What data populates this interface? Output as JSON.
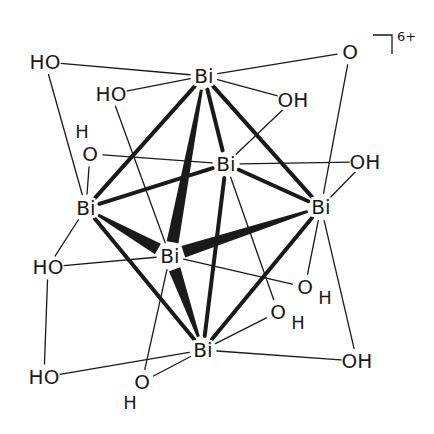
{
  "diagram": {
    "charge": "6+",
    "colors": {
      "bond": "#1a1a1a",
      "background": "#ffffff"
    },
    "atoms": [
      {
        "id": "bi_top",
        "label": "Bi",
        "x": 204,
        "y": 76
      },
      {
        "id": "bi_back",
        "label": "Bi",
        "x": 226,
        "y": 164
      },
      {
        "id": "bi_left",
        "label": "Bi",
        "x": 86,
        "y": 208
      },
      {
        "id": "bi_right",
        "label": "Bi",
        "x": 321,
        "y": 207
      },
      {
        "id": "bi_front",
        "label": "Bi",
        "x": 170,
        "y": 256
      },
      {
        "id": "bi_bottom",
        "label": "Bi",
        "x": 203,
        "y": 350
      },
      {
        "id": "o_tl",
        "label": "HO",
        "x": 45,
        "y": 62
      },
      {
        "id": "o_tl2",
        "label": "HO",
        "x": 111,
        "y": 94
      },
      {
        "id": "o_top_r",
        "label": "OH",
        "x": 293,
        "y": 100
      },
      {
        "id": "o_tr",
        "label": "O",
        "x": 350,
        "y": 52
      },
      {
        "id": "o_left_back",
        "label": "O",
        "x": 90,
        "y": 154
      },
      {
        "id": "o_right_back",
        "label": "OH",
        "x": 365,
        "y": 162
      },
      {
        "id": "o_left_mid",
        "label": "HO",
        "x": 48,
        "y": 267
      },
      {
        "id": "o_right_mid1",
        "label": "O",
        "x": 305,
        "y": 287
      },
      {
        "id": "o_right_mid2",
        "label": "O",
        "x": 278,
        "y": 312
      },
      {
        "id": "o_bottom_r",
        "label": "OH",
        "x": 357,
        "y": 361
      },
      {
        "id": "o_bottom_l",
        "label": "HO",
        "x": 44,
        "y": 377
      },
      {
        "id": "o_bottom_c",
        "label": "O",
        "x": 142,
        "y": 382
      }
    ],
    "h_labels": [
      {
        "id": "h_left_back",
        "label": "H",
        "x": 82,
        "y": 132
      },
      {
        "id": "h_right_mid1",
        "label": "H",
        "x": 325,
        "y": 298
      },
      {
        "id": "h_right_mid2",
        "label": "H",
        "x": 298,
        "y": 323
      },
      {
        "id": "h_bottom_c",
        "label": "H",
        "x": 130,
        "y": 403
      }
    ],
    "bonds_thick": [
      [
        "bi_top",
        "bi_left"
      ],
      [
        "bi_top",
        "bi_back"
      ],
      [
        "bi_top",
        "bi_right"
      ],
      [
        "bi_left",
        "bi_back"
      ],
      [
        "bi_left",
        "bi_bottom"
      ],
      [
        "bi_back",
        "bi_right"
      ],
      [
        "bi_right",
        "bi_bottom"
      ],
      [
        "bi_back",
        "bi_bottom"
      ]
    ],
    "bonds_wedge": [
      [
        "bi_front",
        "bi_top"
      ],
      [
        "bi_front",
        "bi_left"
      ],
      [
        "bi_front",
        "bi_right"
      ],
      [
        "bi_front",
        "bi_bottom"
      ]
    ],
    "bonds_thin": [
      [
        "o_tl",
        "bi_top"
      ],
      [
        "o_tl",
        "bi_left"
      ],
      [
        "o_tl2",
        "bi_top"
      ],
      [
        "o_tl2",
        "bi_front"
      ],
      [
        "o_top_r",
        "bi_top"
      ],
      [
        "o_top_r",
        "bi_back"
      ],
      [
        "o_tr",
        "bi_top"
      ],
      [
        "o_tr",
        "bi_right"
      ],
      [
        "o_left_back",
        "bi_left"
      ],
      [
        "o_left_back",
        "bi_back"
      ],
      [
        "o_right_back",
        "bi_back"
      ],
      [
        "o_right_back",
        "bi_right"
      ],
      [
        "o_left_mid",
        "bi_left"
      ],
      [
        "o_left_mid",
        "bi_front"
      ],
      [
        "o_left_mid",
        "o_bottom_l"
      ],
      [
        "o_right_mid1",
        "bi_front"
      ],
      [
        "o_right_mid1",
        "bi_right"
      ],
      [
        "o_right_mid2",
        "bi_back"
      ],
      [
        "o_right_mid2",
        "bi_bottom"
      ],
      [
        "o_bottom_r",
        "bi_bottom"
      ],
      [
        "o_bottom_r",
        "bi_right"
      ],
      [
        "o_bottom_l",
        "bi_bottom"
      ],
      [
        "o_bottom_c",
        "bi_bottom"
      ],
      [
        "o_bottom_c",
        "bi_front"
      ]
    ]
  }
}
